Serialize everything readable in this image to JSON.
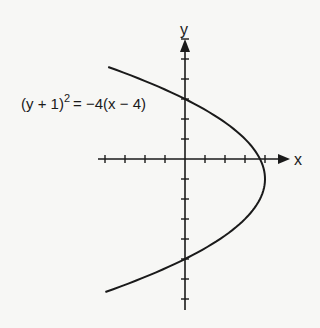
{
  "diagram": {
    "type": "parabola-graph",
    "equation": {
      "lhs_base": "(y + 1)",
      "lhs_exponent": "2",
      "rhs": "= −4(x − 4)"
    },
    "axes": {
      "x_label": "x",
      "y_label": "y",
      "x_ticks": [
        -4,
        -3,
        -2,
        -1,
        1,
        2,
        3,
        4
      ],
      "y_ticks_above": [
        1,
        2,
        3,
        4,
        5,
        6
      ],
      "y_ticks_below": [
        -1,
        -2,
        -3,
        -4,
        -5,
        -6,
        -7
      ]
    },
    "parabola": {
      "vertex": [
        4,
        -1
      ],
      "opens": "left",
      "y_range": [
        -6.65,
        4.6
      ]
    },
    "colors": {
      "ink": "#1a1a1a",
      "paper": "#f7f7f5"
    }
  }
}
